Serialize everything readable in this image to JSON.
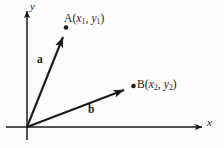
{
  "figure": {
    "type": "vector-diagram",
    "background_color": "#fdfdfd",
    "stroke_color": "#1a1a1a",
    "width": 224,
    "height": 148
  },
  "axes": {
    "x_label": "x",
    "y_label": "y",
    "origin": {
      "x": 27,
      "y": 127
    },
    "x_axis_end": {
      "x": 203,
      "y": 127
    },
    "y_axis_end": {
      "x": 27,
      "y": 9
    },
    "y_axis_below_origin": {
      "x": 27,
      "y": 140
    },
    "arrowheads": [
      "x-axis-tip",
      "y-axis-tip"
    ]
  },
  "vectors": [
    {
      "name": "a",
      "label": "a",
      "from": {
        "x": 27,
        "y": 127
      },
      "to": {
        "x": 66,
        "y": 30
      },
      "point_label": {
        "point": "A",
        "x_var": "x",
        "x_sub": "1",
        "y_var": "y",
        "y_sub": "2_unused"
      },
      "endpoint_dot": {
        "x": 66,
        "y": 28
      }
    },
    {
      "name": "b",
      "label": "b",
      "from": {
        "x": 27,
        "y": 127
      },
      "to": {
        "x": 130,
        "y": 88
      },
      "endpoint_dot": {
        "x": 133,
        "y": 86
      }
    }
  ],
  "labels": {
    "point_a": {
      "point": "A",
      "open_paren": "(",
      "x_var": "x",
      "x_sub": "1",
      "comma": ", ",
      "y_var": "y",
      "y_sub": "1",
      "close_paren": ")"
    },
    "point_b": {
      "point": "B",
      "open_paren": "(",
      "x_var": "x",
      "x_sub": "2",
      "comma": ", ",
      "y_var": "y",
      "y_sub": "2",
      "close_paren": ")"
    },
    "vector_a": "a",
    "vector_b": "b",
    "axis_x": "x",
    "axis_y": "y"
  }
}
